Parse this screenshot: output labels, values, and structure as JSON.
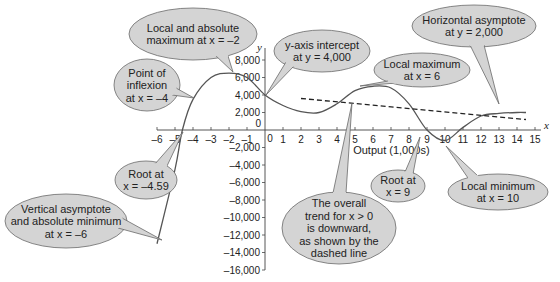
{
  "chart_data": {
    "type": "line",
    "title": "",
    "xlabel": "Output (1,000s)",
    "ylabel": "y",
    "x_axis_name": "x",
    "xlim": [
      -6,
      15
    ],
    "ylim": [
      -16000,
      8000
    ],
    "x_ticks": [
      -6,
      -5,
      -4,
      -3,
      -2,
      -1,
      0,
      1,
      2,
      3,
      4,
      5,
      6,
      7,
      8,
      9,
      10,
      11,
      12,
      13,
      14,
      15
    ],
    "x_tick_labels": [
      "–6",
      "–5",
      "–4",
      "–3",
      "–2",
      "–1",
      "0",
      "1",
      "2",
      "3",
      "4",
      "5",
      "6",
      "7",
      "8",
      "9",
      "10",
      "11",
      "12",
      "13",
      "14",
      "15"
    ],
    "y_ticks": [
      8000,
      6000,
      4000,
      2000,
      0,
      -2000,
      -4000,
      -6000,
      -8000,
      -10000,
      -12000,
      -14000,
      -16000
    ],
    "y_tick_labels": [
      "8,000",
      "6,000",
      "4,000",
      "2,000",
      "0",
      "–2,000",
      "–4,000",
      "–6,000",
      "–8,000",
      "–10,000",
      "–12,000",
      "–14,000",
      "–16,000"
    ],
    "grid": false,
    "series": [
      {
        "name": "function",
        "style": "solid",
        "x": [
          -6,
          -5,
          -4.59,
          -4,
          -3,
          -2,
          -1,
          0,
          1,
          2,
          3,
          4,
          5,
          6,
          7,
          8,
          9,
          10,
          11,
          12,
          13,
          14,
          14.5
        ],
        "y": [
          -13000,
          -4500,
          0,
          3500,
          6000,
          6500,
          6000,
          4000,
          2800,
          2100,
          2000,
          3000,
          4500,
          5000,
          4800,
          3000,
          0,
          -1200,
          300,
          1600,
          1900,
          2000,
          2000
        ]
      },
      {
        "name": "overall trend (x > 0)",
        "style": "dashed",
        "x": [
          2,
          14.5
        ],
        "y": [
          3600,
          1200
        ]
      }
    ],
    "annotations": [
      {
        "text": "Local and absolute maximum at x = –2",
        "x": -2,
        "y": 6500
      },
      {
        "text": "Point of inflexion at x = –4",
        "x": -4,
        "y": 3500
      },
      {
        "text": "y-axis intercept at y = 4,000",
        "x": 0,
        "y": 4000
      },
      {
        "text": "Local maximum at x = 6",
        "x": 6,
        "y": 5000
      },
      {
        "text": "Horizontal asymptote at y = 2,000",
        "x": 13,
        "y": 2000
      },
      {
        "text": "Root at x = –4.59",
        "x": -4.59,
        "y": 0
      },
      {
        "text": "Vertical asymptote and absolute minimum at x = –6",
        "x": -6,
        "y": -13000
      },
      {
        "text": "The overall trend for x > 0 is downward, as shown by the dashed line",
        "x": 4.8,
        "y": 3100
      },
      {
        "text": "Root at x = 9",
        "x": 9,
        "y": 0
      },
      {
        "text": "Local minimum at x = 10",
        "x": 10,
        "y": -1200
      }
    ]
  },
  "labels": {
    "y_axis": "y",
    "x_axis": "x",
    "x_title": "Output (1,000s)",
    "origin_y": "0",
    "origin_x": "0"
  },
  "callouts": {
    "local_abs_max": [
      "Local and absolute",
      "maximum at x = –2"
    ],
    "inflexion": [
      "Point of",
      "inflexion",
      "at x = –4"
    ],
    "y_intercept": [
      "y-axis intercept",
      "at  y = 4,000"
    ],
    "local_max": [
      "Local maximum",
      "at x = 6"
    ],
    "horiz_asymptote": [
      "Horizontal asymptote",
      "at y = 2,000"
    ],
    "root_neg": [
      "Root at",
      "x = –4.59"
    ],
    "vert_asymptote": [
      "Vertical asymptote",
      "and absolute minimum",
      "at x = –6"
    ],
    "trend": [
      "The overall",
      "trend for x > 0",
      "is downward,",
      "as shown by the",
      "dashed line"
    ],
    "root_9": [
      "Root at",
      "x = 9"
    ],
    "local_min": [
      "Local minimum",
      "at x = 10"
    ]
  },
  "colors": {
    "curve": "#555555",
    "bubble_fill": "#d4d4d4",
    "bubble_stroke": "#6a6a6a",
    "axis": "#444444"
  }
}
